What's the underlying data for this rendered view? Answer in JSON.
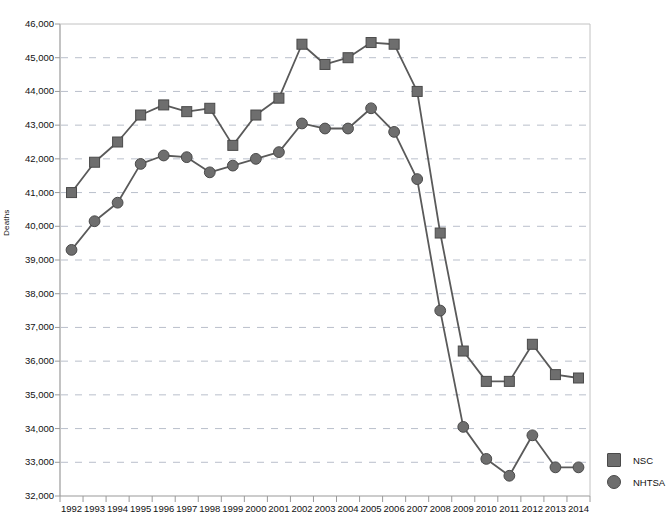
{
  "chart_data": {
    "type": "line",
    "title": "",
    "subtitle": "",
    "xlabel": "",
    "ylabel": "Deaths",
    "x": [
      1992,
      1993,
      1994,
      1995,
      1996,
      1997,
      1998,
      1999,
      2000,
      2001,
      2002,
      2003,
      2004,
      2005,
      2006,
      2007,
      2008,
      2009,
      2010,
      2011,
      2012,
      2013,
      2014
    ],
    "categories": [
      "1992",
      "1993",
      "1994",
      "1995",
      "1996",
      "1997",
      "1998",
      "1999",
      "2000",
      "2001",
      "2002",
      "2003",
      "2004",
      "2005",
      "2006",
      "2007",
      "2008",
      "2009",
      "2010",
      "2011",
      "2012",
      "2013",
      "2014"
    ],
    "series": [
      {
        "name": "NSC",
        "marker": "square",
        "color": "#6e6e6e",
        "line_color": "#5a5a5a",
        "values": [
          41000,
          41900,
          42500,
          43300,
          43600,
          43400,
          43500,
          42400,
          43300,
          43800,
          45400,
          44800,
          45000,
          45450,
          45400,
          44000,
          39800,
          36300,
          35400,
          35400,
          36500,
          35600,
          35500
        ]
      },
      {
        "name": "NHTSA",
        "marker": "circle",
        "color": "#6e6e6e",
        "line_color": "#5a5a5a",
        "values": [
          39300,
          40150,
          40700,
          41850,
          42100,
          42050,
          41600,
          41800,
          42000,
          42200,
          43050,
          42900,
          42900,
          43500,
          42800,
          41400,
          37500,
          34050,
          33100,
          32600,
          33800,
          32850,
          32850
        ]
      }
    ],
    "ylim": [
      32000,
      46000
    ],
    "yticks": [
      32000,
      33000,
      34000,
      35000,
      36000,
      37000,
      38000,
      39000,
      40000,
      41000,
      42000,
      43000,
      44000,
      45000,
      46000
    ],
    "ytick_labels": [
      "32,000",
      "33,000",
      "34,000",
      "35,000",
      "36,000",
      "37,000",
      "38,000",
      "39,000",
      "40,000",
      "41,000",
      "42,000",
      "43,000",
      "44,000",
      "45,000",
      "46,000"
    ],
    "grid": true,
    "grid_style": "dashed-horizontal",
    "grid_color": "#b9bfcb",
    "legend_position": "right",
    "legend_entries": [
      "NSC",
      "NHTSA"
    ],
    "plot_bg": "#ffffff",
    "axis_color": "#9a9a9a"
  },
  "legend": {
    "items": [
      {
        "label": "NSC",
        "marker": "square"
      },
      {
        "label": "NHTSA",
        "marker": "circle"
      }
    ]
  }
}
